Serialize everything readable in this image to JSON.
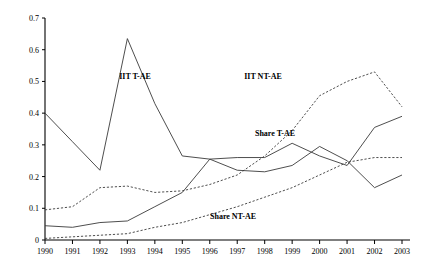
{
  "chart_data": {
    "type": "line",
    "title": "",
    "xlabel": "",
    "ylabel": "",
    "grid": false,
    "legend_position": "inline-annotations",
    "categories": [
      "1990",
      "1991",
      "1992",
      "1993",
      "1994",
      "1995",
      "1996",
      "1997",
      "1998",
      "1999",
      "2000",
      "2001",
      "2002",
      "2003"
    ],
    "x": [
      1990,
      1991,
      1992,
      1993,
      1994,
      1995,
      1996,
      1997,
      1998,
      1999,
      2000,
      2001,
      2002,
      2003
    ],
    "xlim": [
      1990,
      2003
    ],
    "ylim": [
      0,
      0.7
    ],
    "ytick_labels": [
      "0",
      "0.1",
      "0.2",
      "0.3",
      "0.4",
      "0.5",
      "0.6",
      "0.7"
    ],
    "ytick_values": [
      0,
      0.1,
      0.2,
      0.3,
      0.4,
      0.5,
      0.6,
      0.7
    ],
    "series": [
      {
        "name": "IIT T-AE",
        "style": "solid",
        "label_text": "IIT T-AE",
        "values": [
          0.4,
          0.31,
          0.22,
          0.635,
          0.43,
          0.265,
          0.255,
          0.22,
          0.215,
          0.235,
          0.295,
          0.25,
          0.165,
          0.205
        ]
      },
      {
        "name": "IIT NT-AE",
        "style": "dashed",
        "label_text": "IIT NT-AE",
        "values": [
          0.095,
          0.105,
          0.165,
          0.17,
          0.15,
          0.155,
          0.175,
          0.205,
          0.265,
          0.345,
          0.455,
          0.5,
          0.53,
          0.42
        ]
      },
      {
        "name": "Share T-AE",
        "style": "solid",
        "label_text": "Share T-AE",
        "values": [
          0.045,
          0.04,
          0.055,
          0.06,
          0.105,
          0.15,
          0.255,
          0.26,
          0.26,
          0.305,
          0.265,
          0.235,
          0.355,
          0.39
        ]
      },
      {
        "name": "Share NT-AE",
        "style": "dashed",
        "label_text": "Share NT-AE",
        "values": [
          0.005,
          0.01,
          0.015,
          0.02,
          0.04,
          0.055,
          0.08,
          0.105,
          0.135,
          0.165,
          0.205,
          0.245,
          0.26,
          0.26
        ]
      }
    ],
    "annotations": [
      {
        "text": "IIT T-AE",
        "x_px": 135,
        "y_px": 79
      },
      {
        "text": "IIT NT-AE",
        "x_px": 263,
        "y_px": 79
      },
      {
        "text": "Share T-AE",
        "x_px": 275,
        "y_px": 136
      },
      {
        "text": "Share NT-AE",
        "x_px": 233,
        "y_px": 219
      }
    ],
    "colors": {
      "line": "#3a3a3a",
      "axis": "#000000",
      "background": "#ffffff"
    }
  }
}
